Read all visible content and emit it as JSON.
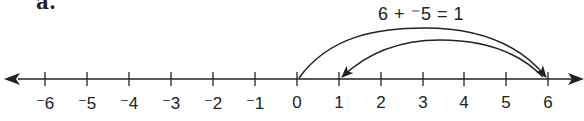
{
  "part_label": "a.",
  "equation": "6 + ⁻5 = 1",
  "number_line": {
    "min": -6,
    "max": 6,
    "tick_labels": [
      "⁻6",
      "⁻5",
      "⁻4",
      "⁻3",
      "⁻2",
      "⁻1",
      "0",
      "1",
      "2",
      "3",
      "4",
      "5",
      "6"
    ],
    "arrows_both_ends": true
  },
  "jumps": [
    {
      "from": 0,
      "to": 6,
      "label": "+6"
    },
    {
      "from": 6,
      "to": 1,
      "label": "-5"
    }
  ],
  "colors": {
    "ink": "#222222",
    "background": "#ffffff"
  }
}
